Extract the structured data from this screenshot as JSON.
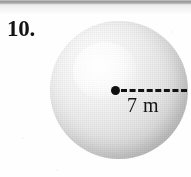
{
  "figure": {
    "problem_number": "10.",
    "shape": "sphere",
    "measurement_label": "7 m",
    "measurement_value": 7,
    "measurement_unit": "m",
    "measurement_type": "radius",
    "colors": {
      "ink": "#131313",
      "sphere_light": "#ffffff",
      "sphere_mid": "#dcdcdc",
      "sphere_shadow": "#a8a8a8",
      "page_background": "#fefefe",
      "scan_band": "#8e8e8e"
    }
  }
}
